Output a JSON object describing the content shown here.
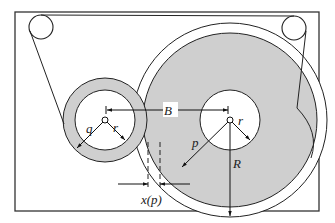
{
  "figure": {
    "type": "tape-reel-transport-diagram",
    "colors": {
      "stroke": "#222222",
      "tape_fill": "#cfcfcf",
      "background": "#ffffff"
    },
    "labels": {
      "q": "q",
      "r_small": "r",
      "B": "B",
      "r_large": "r",
      "p": "p",
      "R": "R",
      "xp": "x(p)"
    }
  }
}
